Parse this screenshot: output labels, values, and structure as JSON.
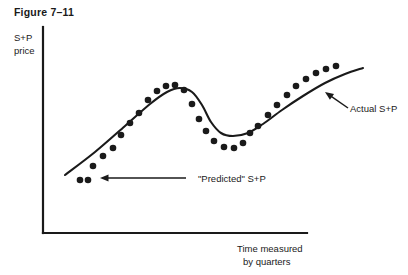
{
  "figure": {
    "title": "Figure 7–11"
  },
  "chart_data": {
    "type": "scatter",
    "title": "Figure 7–11",
    "xlabel": "Time measured by quarters",
    "ylabel": "S+P price",
    "xlabel_line1": "Time measured",
    "xlabel_line2": "by quarters",
    "ylabel_line1": "S+P",
    "ylabel_line2": "price",
    "grid": false,
    "legend_position": "inline-annotations",
    "xlim": [
      0,
      100
    ],
    "ylim": [
      0,
      100
    ],
    "series": [
      {
        "name": "\"Predicted\" S+P",
        "role": "markers",
        "marker": "filled-circle",
        "color": "#1a1a1a",
        "points": [
          [
            80,
            180
          ],
          [
            88,
            180
          ],
          [
            93,
            166
          ],
          [
            103,
            156
          ],
          [
            113,
            148
          ],
          [
            121,
            135
          ],
          [
            130,
            123
          ],
          [
            139,
            113
          ],
          [
            148,
            100
          ],
          [
            157,
            91
          ],
          [
            166,
            86
          ],
          [
            175,
            85
          ],
          [
            184,
            90
          ],
          [
            192,
            104
          ],
          [
            199,
            119
          ],
          [
            206,
            131
          ],
          [
            214,
            141
          ],
          [
            224,
            147
          ],
          [
            234,
            148
          ],
          [
            243,
            143
          ],
          [
            250,
            133
          ],
          [
            258,
            126
          ],
          [
            268,
            115
          ],
          [
            277,
            105
          ],
          [
            287,
            95
          ],
          [
            296,
            86
          ],
          [
            306,
            79
          ],
          [
            316,
            73
          ],
          [
            326,
            69
          ],
          [
            336,
            66
          ]
        ]
      },
      {
        "name": "Actual S+P",
        "role": "curve",
        "color": "#1a1a1a",
        "path_points": [
          [
            65,
            175
          ],
          [
            95,
            152
          ],
          [
            125,
            126
          ],
          [
            150,
            104
          ],
          [
            167,
            92
          ],
          [
            180,
            88
          ],
          [
            192,
            92
          ],
          [
            202,
            105
          ],
          [
            211,
            122
          ],
          [
            221,
            133
          ],
          [
            233,
            136
          ],
          [
            248,
            133
          ],
          [
            263,
            124
          ],
          [
            282,
            110
          ],
          [
            303,
            96
          ],
          [
            325,
            83
          ],
          [
            345,
            74
          ],
          [
            363,
            68
          ]
        ]
      }
    ],
    "annotations": [
      {
        "name": "predicted-annotation",
        "text": "\"Predicted\" S+P",
        "text_x": 198,
        "text_y": 182,
        "arrow_from": [
          186,
          178
        ],
        "arrow_to": [
          100,
          178
        ],
        "direction": "left"
      },
      {
        "name": "actual-annotation",
        "text": "Actual  S+P",
        "text_x": 350,
        "text_y": 112,
        "arrow_from": [
          348,
          108
        ],
        "arrow_to": [
          325,
          92
        ],
        "direction": "up-left"
      }
    ],
    "axes": {
      "y_axis": {
        "x": 43,
        "y_top": 27,
        "y_bottom": 233
      },
      "x_axis": {
        "y": 233,
        "x_left": 43,
        "x_right": 307
      }
    }
  },
  "colors": {
    "ink": "#1a1a1a",
    "background": "#ffffff"
  }
}
